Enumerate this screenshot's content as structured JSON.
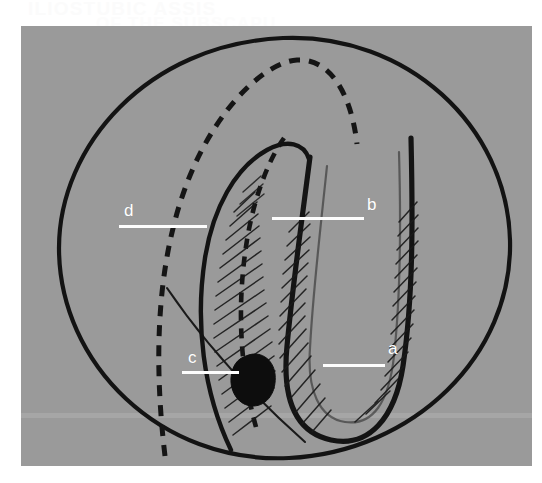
{
  "figure": {
    "kind": "anatomical-line-drawing",
    "background_color": "#ffffff",
    "plate_color": "#9a9a9a",
    "ink_color": "#111111",
    "label_color": "#ffffff",
    "ghost_text_line1": "ILIOSTUBIC ASSIS",
    "ghost_text_line2": "OF THE SUBSCAPU",
    "labels": [
      {
        "id": "label-a",
        "text": "a",
        "x": 388,
        "y": 340,
        "leader_x": 323,
        "leader_y": 364,
        "leader_w": 62
      },
      {
        "id": "label-b",
        "text": "b",
        "x": 367,
        "y": 196,
        "leader_x": 272,
        "leader_y": 217,
        "leader_w": 92
      },
      {
        "id": "label-c",
        "text": "c",
        "x": 188,
        "y": 349,
        "leader_x": 182,
        "leader_y": 371,
        "leader_w": 57
      },
      {
        "id": "label-d",
        "text": "d",
        "x": 124,
        "y": 202,
        "leader_x": 119,
        "leader_y": 225,
        "leader_w": 88
      }
    ]
  }
}
